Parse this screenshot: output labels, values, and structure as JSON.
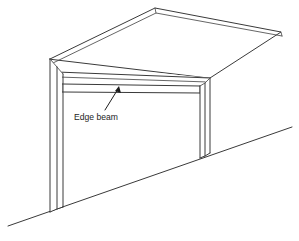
{
  "figure": {
    "type": "line-drawing",
    "view": "isometric-perspective",
    "background_color": "#ffffff",
    "line_color": "#3a3a3a",
    "annotation_color": "#1d1d1d"
  },
  "annotations": [
    {
      "id": "edge-beam",
      "label": "Edge beam",
      "label_x": 74,
      "label_y": 118,
      "leader_from_x": 106,
      "leader_from_y": 109,
      "leader_to_x": 119,
      "leader_to_y": 87,
      "arrow_at": "beam"
    }
  ],
  "geometry": {
    "roof": {
      "apex_x": 155,
      "apex_y": 8,
      "right_corner_x": 281,
      "right_corner_y": 32,
      "left_back_x": 50,
      "left_back_y": 59,
      "front_right_x": 210,
      "front_right_y": 78,
      "thickness_px": 4
    },
    "left_column": {
      "top_x": 50,
      "top_y": 59,
      "base_y": 212,
      "width_px": 12
    },
    "right_column": {
      "top_x": 200,
      "top_y": 78,
      "base_y": 158,
      "width_px": 10
    },
    "edge_beam": {
      "left_x": 62,
      "left_y": 84,
      "right_x": 200,
      "right_y": 86,
      "depth_px": 6
    },
    "ground_line": {
      "start_x": 8,
      "start_y": 225,
      "end_x": 292,
      "end_y": 127
    }
  },
  "labels": {
    "edge_beam": "Edge beam"
  }
}
